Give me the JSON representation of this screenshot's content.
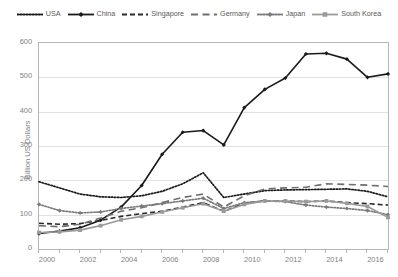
{
  "chart_data": {
    "type": "line",
    "title": "",
    "xlabel": "",
    "ylabel": "Billion US Dollars",
    "xlim": [
      2000,
      2017
    ],
    "ylim": [
      0,
      600
    ],
    "ytick_values": [
      0,
      100,
      200,
      300,
      400,
      500,
      600
    ],
    "ytick_labels": [
      "0",
      "100",
      "200",
      "300",
      "400",
      "500",
      "600"
    ],
    "xtick_labels": [
      "2000",
      "2002",
      "2004",
      "2006",
      "2008",
      "2010",
      "2012",
      "2014",
      "2016"
    ],
    "xtick_values": [
      2000,
      2002,
      2004,
      2006,
      2008,
      2010,
      2012,
      2014,
      2016
    ],
    "x": [
      2000,
      2001,
      2002,
      2003,
      2004,
      2005,
      2006,
      2007,
      2008,
      2009,
      2010,
      2011,
      2012,
      2013,
      2014,
      2015,
      2016,
      2017
    ],
    "grid": "horizontal",
    "legend_position": "top",
    "series": [
      {
        "name": "USA",
        "style": "dotted",
        "color": "#1a1a1a",
        "marker": "none",
        "values": [
          196,
          178,
          160,
          152,
          150,
          155,
          168,
          190,
          222,
          150,
          160,
          170,
          172,
          173,
          174,
          175,
          168,
          152
        ]
      },
      {
        "name": "China",
        "style": "solid",
        "color": "#1a1a1a",
        "marker": "diamond",
        "values": [
          45,
          52,
          62,
          84,
          122,
          185,
          276,
          340,
          345,
          303,
          412,
          465,
          498,
          568,
          570,
          553,
          500,
          510
        ]
      },
      {
        "name": "Singapore",
        "style": "dashed",
        "color": "#2b2b2b",
        "marker": "none",
        "values": [
          75,
          72,
          74,
          83,
          95,
          103,
          110,
          122,
          135,
          110,
          133,
          140,
          140,
          138,
          140,
          135,
          132,
          128
        ]
      },
      {
        "name": "Germany",
        "style": "longdash",
        "color": "#6e6e6e",
        "marker": "none",
        "values": [
          68,
          65,
          72,
          90,
          110,
          120,
          135,
          150,
          160,
          122,
          155,
          175,
          178,
          180,
          190,
          188,
          186,
          182
        ]
      },
      {
        "name": "Japan",
        "style": "dotted-marker",
        "color": "#7a7a7a",
        "marker": "diamond",
        "values": [
          130,
          112,
          105,
          108,
          118,
          125,
          132,
          140,
          148,
          118,
          135,
          140,
          138,
          128,
          122,
          118,
          112,
          100
        ]
      },
      {
        "name": "South Korea",
        "style": "solid",
        "color": "#9a9a9a",
        "marker": "square",
        "values": [
          48,
          50,
          55,
          68,
          85,
          95,
          108,
          120,
          132,
          110,
          130,
          140,
          140,
          138,
          140,
          133,
          124,
          92
        ]
      }
    ]
  },
  "legend": {
    "items": [
      {
        "label": "USA",
        "style": "dotted",
        "color": "#1a1a1a",
        "marker": "none"
      },
      {
        "label": "China",
        "style": "solid",
        "color": "#1a1a1a",
        "marker": "diamond"
      },
      {
        "label": "Singapore",
        "style": "dashed",
        "color": "#2b2b2b",
        "marker": "none"
      },
      {
        "label": "Germany",
        "style": "longdash",
        "color": "#6e6e6e",
        "marker": "none"
      },
      {
        "label": "Japan",
        "style": "dotted-marker",
        "color": "#7a7a7a",
        "marker": "diamond"
      },
      {
        "label": "South Korea",
        "style": "solid",
        "color": "#9a9a9a",
        "marker": "square"
      }
    ]
  },
  "axes": {
    "y_title": "Billion US Dollars"
  }
}
